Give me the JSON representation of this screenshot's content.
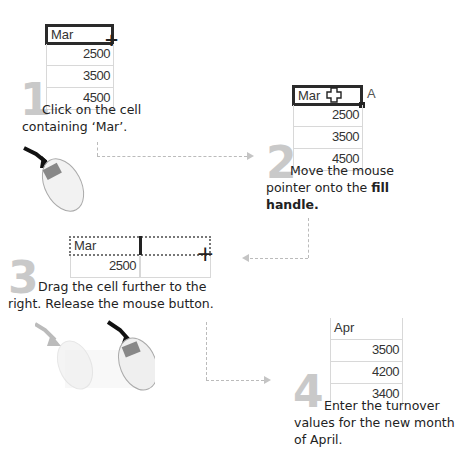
{
  "steps": [
    {
      "number": "1",
      "caption": "Click on the cell containing ‘Mar’.",
      "table": {
        "header": "Mar",
        "values": [
          "2500",
          "3500",
          "4500"
        ]
      }
    },
    {
      "number": "2",
      "caption_plain": "Move the mouse pointer onto the ",
      "caption_bold": "fill handle.",
      "table": {
        "header": "Mar",
        "values": [
          "2500",
          "3500",
          "4500"
        ],
        "next_col_partial": "A"
      }
    },
    {
      "number": "3",
      "caption": "Drag the cell further to the right. Release the mouse button.",
      "table": {
        "header": "Mar",
        "values": [
          "2500"
        ]
      }
    },
    {
      "number": "4",
      "caption": "Enter the turnover values for the new month of April.",
      "table": {
        "header": "Apr",
        "values": [
          "3500",
          "4200",
          "3400"
        ]
      }
    }
  ],
  "colors": {
    "step_number": "#c9c9c9",
    "arrow": "#c4c4c4",
    "selection_border": "#2a2a2a"
  }
}
